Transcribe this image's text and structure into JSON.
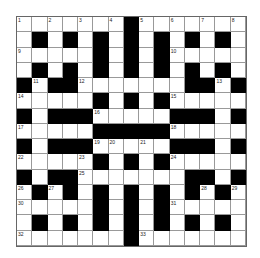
{
  "puzzle": {
    "rows": 15,
    "cols": 15,
    "layout": [
      ".......#.......",
      ".#.#.#.#.#.#.#.",
      ".....#.#.#.....",
      ".#.#.#.#.#.#.#.",
      "#.##.......##.#",
      ".....#.#.#.....",
      "#.###.....###.#",
      ".....#####.....",
      "#.###.....###.#",
      ".....#.#.#.....",
      "#.##.......##.#",
      ".#.#.#.#.#.#.#.",
      ".....#.#.#.....",
      ".#.#.#.#.#.#.#.",
      ".......#......."
    ],
    "numbers": [
      {
        "r": 0,
        "c": 0,
        "n": "1"
      },
      {
        "r": 0,
        "c": 2,
        "n": "2"
      },
      {
        "r": 0,
        "c": 4,
        "n": "3"
      },
      {
        "r": 0,
        "c": 6,
        "n": "4"
      },
      {
        "r": 0,
        "c": 8,
        "n": "5"
      },
      {
        "r": 0,
        "c": 10,
        "n": "6"
      },
      {
        "r": 0,
        "c": 12,
        "n": "7"
      },
      {
        "r": 0,
        "c": 14,
        "n": "8"
      },
      {
        "r": 2,
        "c": 0,
        "n": "9"
      },
      {
        "r": 2,
        "c": 10,
        "n": "10"
      },
      {
        "r": 4,
        "c": 1,
        "n": "11"
      },
      {
        "r": 4,
        "c": 4,
        "n": "12"
      },
      {
        "r": 4,
        "c": 13,
        "n": "13"
      },
      {
        "r": 5,
        "c": 0,
        "n": "14"
      },
      {
        "r": 5,
        "c": 10,
        "n": "15"
      },
      {
        "r": 6,
        "c": 5,
        "n": "16"
      },
      {
        "r": 7,
        "c": 0,
        "n": "17"
      },
      {
        "r": 7,
        "c": 10,
        "n": "18"
      },
      {
        "r": 8,
        "c": 5,
        "n": "19"
      },
      {
        "r": 8,
        "c": 6,
        "n": "20"
      },
      {
        "r": 8,
        "c": 8,
        "n": "21"
      },
      {
        "r": 9,
        "c": 0,
        "n": "22"
      },
      {
        "r": 9,
        "c": 4,
        "n": "23"
      },
      {
        "r": 9,
        "c": 10,
        "n": "24"
      },
      {
        "r": 10,
        "c": 4,
        "n": "25"
      },
      {
        "r": 11,
        "c": 0,
        "n": "26"
      },
      {
        "r": 11,
        "c": 2,
        "n": "27"
      },
      {
        "r": 11,
        "c": 12,
        "n": "28"
      },
      {
        "r": 11,
        "c": 14,
        "n": "29"
      },
      {
        "r": 12,
        "c": 0,
        "n": "30"
      },
      {
        "r": 12,
        "c": 10,
        "n": "31"
      },
      {
        "r": 14,
        "c": 0,
        "n": "32"
      },
      {
        "r": 14,
        "c": 8,
        "n": "33"
      }
    ]
  }
}
